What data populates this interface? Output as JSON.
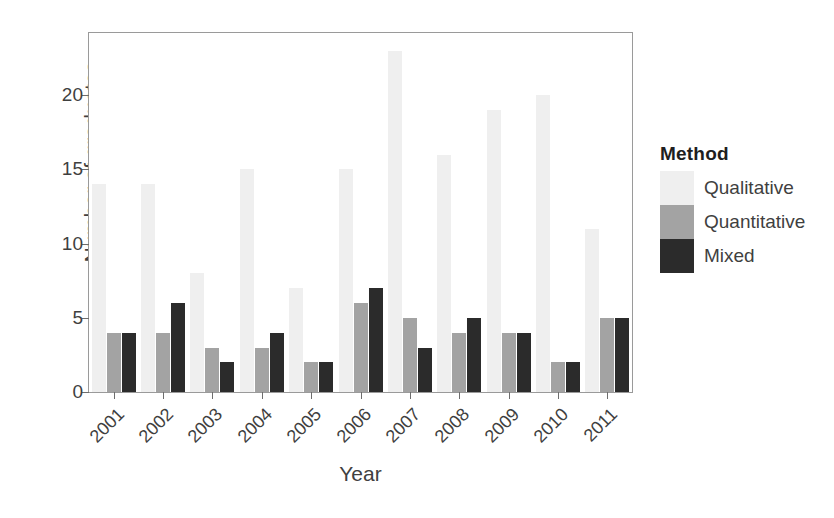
{
  "chart_data": {
    "type": "bar",
    "title": "",
    "xlabel": "Year",
    "ylabel": "Number of graduates",
    "categories": [
      "2001",
      "2002",
      "2003",
      "2004",
      "2005",
      "2006",
      "2007",
      "2008",
      "2009",
      "2010",
      "2011"
    ],
    "series": [
      {
        "name": "Qualitative",
        "color": "#efefef",
        "values": [
          14,
          14,
          8,
          15,
          7,
          15,
          23,
          16,
          19,
          20,
          11
        ]
      },
      {
        "name": "Quantitative",
        "color": "#a3a3a3",
        "values": [
          4,
          4,
          3,
          3,
          2,
          6,
          5,
          4,
          4,
          2,
          5
        ]
      },
      {
        "name": "Mixed",
        "color": "#2b2b2b",
        "values": [
          4,
          6,
          2,
          4,
          2,
          7,
          3,
          5,
          4,
          2,
          5
        ]
      }
    ],
    "yticks": [
      0,
      5,
      10,
      15,
      20
    ],
    "ylim": [
      0,
      24.2
    ],
    "grid": false,
    "legend": {
      "title": "Method",
      "position": "right"
    },
    "panel_border_color": "#9a9a9a",
    "axis_text_color": "#3f3f3f",
    "background": "#ffffff"
  }
}
